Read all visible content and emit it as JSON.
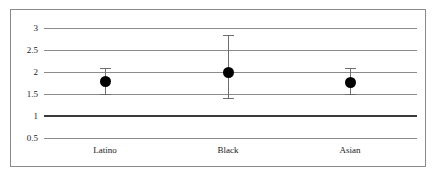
{
  "chart_data": {
    "type": "scatter",
    "title": "",
    "subtitle": "",
    "xlabel": "",
    "ylabel": "",
    "categories": [
      "Latino",
      "Black",
      "Asian"
    ],
    "values": [
      1.8,
      2.0,
      1.78
    ],
    "error_high": [
      2.1,
      2.85,
      2.1
    ],
    "error_low": [
      1.5,
      1.4,
      1.5
    ],
    "series": [
      {
        "name": "Estimate",
        "points": [
          {
            "category": "Latino",
            "value": 1.8,
            "ci_low": 1.5,
            "ci_high": 2.1
          },
          {
            "category": "Black",
            "value": 2.0,
            "ci_low": 1.4,
            "ci_high": 2.85
          },
          {
            "category": "Asian",
            "value": 1.78,
            "ci_low": 1.5,
            "ci_high": 2.1
          }
        ]
      }
    ],
    "ylim": [
      0.5,
      3.0
    ],
    "yticks": [
      3,
      2.5,
      2,
      1.5,
      1,
      0.5
    ],
    "ytick_labels": [
      "3",
      "2.5",
      "2",
      "1.5",
      "1",
      "0.5"
    ],
    "grid": true,
    "legend": "none",
    "reference_line": 1,
    "annotations": [],
    "colors": {
      "marker": "#000000",
      "error_bar": "#6e6e6e",
      "gridline": "#8c8c8c",
      "reference_line": "#3a3a3a",
      "frame": "#8a8a8a",
      "background": "#ffffff",
      "text": "#1a1a1a"
    }
  }
}
